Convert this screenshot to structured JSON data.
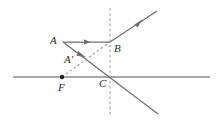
{
  "figure": {
    "background_color": "#ffffff",
    "stroke_color": "#6e6e6e",
    "axis_color": "#8a8a8a",
    "dashed_color": "#9a9a9a",
    "label_color": "#2b2b2b",
    "width": 223,
    "height": 129
  },
  "labels": [
    {
      "id": "A",
      "text": "A",
      "x": 50,
      "y": 36
    },
    {
      "id": "Ap",
      "text": "A'",
      "x": 64,
      "y": 55
    },
    {
      "id": "B",
      "text": "B",
      "x": 114,
      "y": 43
    },
    {
      "id": "C",
      "text": "C",
      "x": 99,
      "y": 78
    },
    {
      "id": "F",
      "text": "F",
      "x": 58,
      "y": 82
    }
  ],
  "points": [
    {
      "id": "A",
      "name": "object-point-a",
      "x": 63,
      "y": 42
    },
    {
      "id": "Ap",
      "name": "image-point-a-prime",
      "x": 78,
      "y": 55
    },
    {
      "id": "B",
      "name": "lens-point-b",
      "x": 110,
      "y": 42
    },
    {
      "id": "C",
      "name": "axis-point-c",
      "x": 110,
      "y": 77
    },
    {
      "id": "F",
      "name": "focal-point-f",
      "x": 62,
      "y": 77
    }
  ],
  "geometry": {
    "principal_axis": {
      "x1": 13,
      "y1": 77,
      "x2": 210,
      "y2": 77
    },
    "lens_plane": {
      "x1": 110,
      "y1": 8,
      "x2": 110,
      "y2": 116
    },
    "incident_ray": {
      "x1": 63,
      "y1": 42,
      "x2": 110,
      "y2": 42,
      "arrow_x": 88,
      "arrow_y": 42
    },
    "refracted_ray_upper": {
      "x1": 110,
      "y1": 42,
      "x2": 157,
      "y2": 11,
      "arrow_x": 139,
      "arrow_y": 23
    },
    "ray_through_center": {
      "x1": 63,
      "y1": 42,
      "x2": 158,
      "y2": 114,
      "arrow_x": 84,
      "arrow_y": 58
    },
    "construction_line": {
      "x1": 62,
      "y1": 77,
      "x2": 110,
      "y2": 42
    }
  },
  "focal_dot": {
    "cx": 62,
    "cy": 77,
    "r": 2.1
  }
}
